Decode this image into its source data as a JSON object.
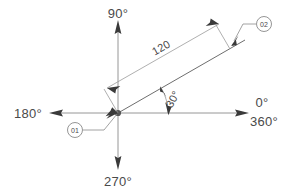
{
  "diagram": {
    "type": "cad-angular-dimension",
    "background_color": "#ffffff",
    "line_color": "#8a8a8a",
    "text_color": "#4a4a4a",
    "origin": {
      "x": 118,
      "y": 113
    },
    "axes": [
      {
        "name": "east-axis",
        "label": "0°",
        "secondary_label": "360°",
        "direction_deg": 0
      },
      {
        "name": "north-axis",
        "label": "90°",
        "direction_deg": 90
      },
      {
        "name": "west-axis",
        "label": "180°",
        "direction_deg": 180
      },
      {
        "name": "south-axis",
        "label": "270°",
        "direction_deg": 270
      }
    ],
    "labels": {
      "east_primary": "0°",
      "east_secondary": "360°",
      "north": "90°",
      "west": "180°",
      "south": "270°"
    },
    "dimensions": {
      "length_label": "120",
      "angle_label": "30°",
      "angle_value_deg": 30,
      "length_value": 120
    },
    "balloons": [
      {
        "name": "balloon-01",
        "label": "01",
        "cx": 75,
        "cy": 130,
        "r": 7.5
      },
      {
        "name": "balloon-02",
        "label": "02",
        "cx": 264,
        "cy": 24,
        "r": 7.5
      }
    ]
  }
}
